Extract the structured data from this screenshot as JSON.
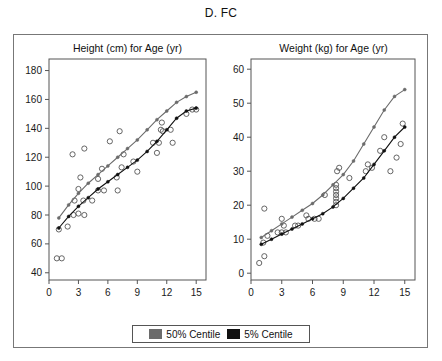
{
  "figure": {
    "title": "D. FC"
  },
  "legend": {
    "items": [
      {
        "label": "50% Centile",
        "color": "#6b6b6b"
      },
      {
        "label": "5% Centile",
        "color": "#111111"
      }
    ]
  },
  "chart_data": [
    {
      "type": "line",
      "panel": "left",
      "title": "Height (cm) for Age (yr)",
      "xlabel": "Age (yr)",
      "ylabel": "Height (cm)",
      "xlim": [
        0,
        16
      ],
      "ylim": [
        35,
        188
      ],
      "xticks": [
        0,
        3,
        6,
        9,
        12,
        15
      ],
      "yticks": [
        40,
        60,
        80,
        100,
        120,
        140,
        160,
        180
      ],
      "grid": false,
      "legend_position": "bottom-center",
      "series": [
        {
          "name": "50% Centile",
          "color": "#6b6b6b",
          "marker": "filled-circle",
          "x": [
            1,
            2,
            3,
            4,
            5,
            6,
            7,
            8,
            9,
            10,
            11,
            12,
            13,
            14,
            15
          ],
          "y": [
            78,
            87,
            95,
            102,
            108,
            114,
            120,
            126,
            132,
            139,
            146,
            152,
            158,
            162,
            165
          ]
        },
        {
          "name": "5% Centile",
          "color": "#111111",
          "marker": "filled-circle",
          "x": [
            1,
            2,
            3,
            4,
            5,
            6,
            7,
            8,
            9,
            10,
            11,
            12,
            13,
            14,
            15
          ],
          "y": [
            71,
            79,
            86,
            92,
            98,
            103,
            108,
            113,
            118,
            124,
            131,
            139,
            147,
            152,
            154
          ]
        }
      ],
      "scatter": {
        "name": "Observed subjects",
        "marker": "open-circle",
        "color": "#555555",
        "points": [
          [
            0.8,
            50
          ],
          [
            1.3,
            50
          ],
          [
            1.0,
            70
          ],
          [
            1.9,
            72
          ],
          [
            2.5,
            80
          ],
          [
            3.0,
            81
          ],
          [
            3.6,
            80
          ],
          [
            2.6,
            90
          ],
          [
            3.5,
            90
          ],
          [
            4.4,
            90
          ],
          [
            3.0,
            98
          ],
          [
            3.2,
            106
          ],
          [
            2.4,
            122
          ],
          [
            3.6,
            126
          ],
          [
            5.0,
            97
          ],
          [
            5.6,
            97
          ],
          [
            5.0,
            105
          ],
          [
            5.4,
            112
          ],
          [
            6.2,
            131
          ],
          [
            6.9,
            106
          ],
          [
            7.0,
            97
          ],
          [
            7.4,
            113
          ],
          [
            7.6,
            122
          ],
          [
            7.2,
            138
          ],
          [
            8.6,
            117
          ],
          [
            9.0,
            110
          ],
          [
            10.6,
            130
          ],
          [
            11.0,
            123
          ],
          [
            11.2,
            130
          ],
          [
            11.4,
            139
          ],
          [
            11.6,
            138
          ],
          [
            11.5,
            144
          ],
          [
            12.4,
            139
          ],
          [
            12.6,
            130
          ],
          [
            14.0,
            150
          ],
          [
            14.6,
            153
          ],
          [
            15.0,
            153
          ]
        ]
      }
    },
    {
      "type": "line",
      "panel": "right",
      "title": "Weight (kg) for Age (yr)",
      "xlabel": "Age (yr)",
      "ylabel": "Weight (kg)",
      "xlim": [
        0,
        16
      ],
      "ylim": [
        -2,
        63
      ],
      "xticks": [
        0,
        3,
        6,
        9,
        12,
        15
      ],
      "yticks": [
        0,
        10,
        20,
        30,
        40,
        50,
        60
      ],
      "grid": false,
      "legend_position": "bottom-center",
      "series": [
        {
          "name": "50% Centile",
          "color": "#6b6b6b",
          "marker": "filled-circle",
          "x": [
            1,
            2,
            3,
            4,
            5,
            6,
            7,
            8,
            9,
            10,
            11,
            12,
            13,
            14,
            15
          ],
          "y": [
            10.5,
            12.5,
            14.5,
            16.5,
            18.5,
            20.5,
            23,
            26,
            29,
            33,
            38,
            43,
            48,
            52,
            54
          ]
        },
        {
          "name": "5% Centile",
          "color": "#111111",
          "marker": "filled-circle",
          "x": [
            1,
            2,
            3,
            4,
            5,
            6,
            7,
            8,
            9,
            10,
            11,
            12,
            13,
            14,
            15
          ],
          "y": [
            8.5,
            10,
            11.5,
            13,
            14.5,
            16,
            17.5,
            19.5,
            22,
            25,
            28,
            32,
            36,
            40,
            43
          ]
        }
      ],
      "scatter": {
        "name": "Observed subjects",
        "marker": "open-circle",
        "color": "#555555",
        "points": [
          [
            0.8,
            3
          ],
          [
            1.3,
            5
          ],
          [
            1.2,
            9
          ],
          [
            1.6,
            11
          ],
          [
            1.3,
            19
          ],
          [
            2.6,
            12
          ],
          [
            3.0,
            12
          ],
          [
            3.4,
            12
          ],
          [
            3.2,
            14
          ],
          [
            3.0,
            16
          ],
          [
            4.3,
            14
          ],
          [
            4.6,
            14
          ],
          [
            5.4,
            17
          ],
          [
            5.6,
            16
          ],
          [
            6.2,
            16
          ],
          [
            6.6,
            16
          ],
          [
            7.2,
            23
          ],
          [
            8.3,
            20
          ],
          [
            8.3,
            21
          ],
          [
            8.3,
            22
          ],
          [
            8.3,
            23
          ],
          [
            8.3,
            24
          ],
          [
            8.3,
            25
          ],
          [
            8.3,
            26
          ],
          [
            8.4,
            30
          ],
          [
            8.6,
            31
          ],
          [
            9.6,
            28
          ],
          [
            11.2,
            30
          ],
          [
            11.4,
            32
          ],
          [
            11.8,
            31
          ],
          [
            12.6,
            36
          ],
          [
            13.0,
            40
          ],
          [
            13.6,
            30
          ],
          [
            14.2,
            34
          ],
          [
            14.6,
            38
          ],
          [
            14.8,
            44
          ]
        ]
      }
    }
  ]
}
